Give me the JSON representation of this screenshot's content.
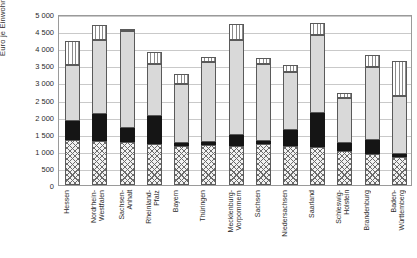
{
  "chart": {
    "ylabel": "Euro je Einwohner",
    "ytick_labels": [
      "0",
      "500",
      "1 000",
      "1 500",
      "2 000",
      "2 500",
      "3 000",
      "3 500",
      "4 000",
      "4 500",
      "5 000"
    ]
  },
  "chart_data": {
    "type": "bar",
    "title": "",
    "subtitle": "",
    "xlabel": "",
    "ylabel": "Euro je Einwohner",
    "ylim": [
      0,
      5000
    ],
    "ytick_step": 500,
    "grid": true,
    "legend": "none",
    "stacked": true,
    "bar_style": "stacked-vertical",
    "categories": [
      "Hessen",
      "Nordrhein-\nWestfalen",
      "Sachsen-\nAnhalt",
      "Rheinland-\nPfalz",
      "Bayern",
      "Thüringen",
      "Mecklenburg-\nVorpommern",
      "Sachsen",
      "Niedersachsen",
      "Saarland",
      "Schleswig-\nHolstein",
      "Brandenburg",
      "Baden-\nWürttemberg"
    ],
    "series": [
      {
        "name": "segment-1-crosshatch",
        "pattern": "crosshatch",
        "color": "#f2f2f2",
        "values": [
          1320,
          1280,
          1250,
          1200,
          1150,
          1180,
          1150,
          1200,
          1150,
          1100,
          1000,
          900,
          820
        ]
      },
      {
        "name": "segment-2-black",
        "pattern": "solid",
        "color": "#151515",
        "values": [
          550,
          790,
          410,
          820,
          70,
          70,
          300,
          80,
          450,
          1000,
          220,
          430,
          80
        ]
      },
      {
        "name": "segment-3-lightgray",
        "pattern": "solid",
        "color": "#d9d9d9",
        "values": [
          1630,
          2180,
          2830,
          1530,
          1730,
          2350,
          2800,
          2270,
          1700,
          2300,
          1330,
          2120,
          1700
        ]
      },
      {
        "name": "segment-4-vertical-stripes",
        "pattern": "vertical-stripes",
        "color": "#ffffff",
        "values": [
          700,
          430,
          70,
          350,
          300,
          150,
          450,
          150,
          200,
          350,
          150,
          350,
          1020
        ]
      }
    ],
    "totals": [
      4200,
      4680,
      4560,
      3900,
      3250,
      3750,
      4700,
      3700,
      3500,
      4750,
      2700,
      3800,
      3620
    ]
  }
}
